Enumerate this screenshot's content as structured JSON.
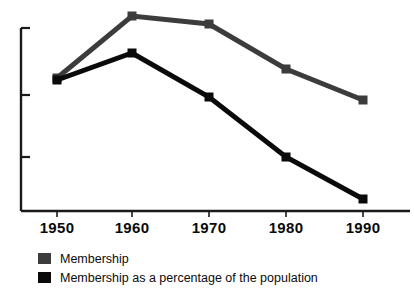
{
  "chart_data": {
    "type": "line",
    "title": "",
    "subtitle": "",
    "xlabel": "",
    "ylabel": "",
    "x": [
      1950,
      1960,
      1970,
      1980,
      1990
    ],
    "categories": [
      "1950",
      "1960",
      "1970",
      "1980",
      "1990"
    ],
    "xlim": [
      1945,
      1995
    ],
    "ylim": [
      0,
      100
    ],
    "grid": false,
    "y_axis_tick_labels": [],
    "y_axis_tick_count": 3,
    "legend_position": "below-left",
    "series": [
      {
        "name": "Membership",
        "color": "#3c3c3c",
        "marker": "square",
        "values": [
          52,
          97,
          93,
          78,
          63
        ],
        "pixel_y": [
          78,
          16,
          24,
          69,
          100
        ]
      },
      {
        "name": "Membership as a percentage of the population",
        "color": "#0a0a0a",
        "marker": "square",
        "values": [
          51,
          79,
          57,
          36,
          15
        ],
        "pixel_y": [
          80,
          53,
          97,
          157,
          199
        ]
      }
    ],
    "annotations": []
  },
  "axes": {
    "x_tick_labels": [
      "1950",
      "1960",
      "1970",
      "1980",
      "1990"
    ],
    "x_tick_pixels": [
      57,
      132,
      209,
      286,
      363
    ],
    "y_tick_pixels": [
      28,
      95,
      157
    ],
    "baseline_y": 211,
    "axis_x": 21,
    "axis_color": "#1a1a1a"
  },
  "legend": {
    "items": [
      {
        "label": "Membership",
        "color": "#3c3c3c"
      },
      {
        "label": "Membership as a percentage of the population",
        "color": "#0a0a0a"
      }
    ]
  }
}
